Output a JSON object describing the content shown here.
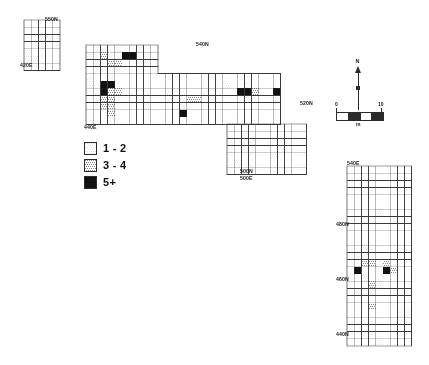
{
  "figure": {
    "type": "archaeological-site-plan",
    "background_color": "#ffffff",
    "line_color": "#3a3a3a"
  },
  "legend": {
    "title": "",
    "items": [
      {
        "label": "1 - 2",
        "fill": "#d9d9d9",
        "pattern": "light-stipple",
        "range_min": 1,
        "range_max": 2
      },
      {
        "label": "3 - 4",
        "fill": "#8a8a8a",
        "pattern": "medium-stipple",
        "range_min": 3,
        "range_max": 4
      },
      {
        "label": "5+",
        "fill": "#111111",
        "pattern": "solid",
        "range_min": 5,
        "range_max": null
      }
    ]
  },
  "north_arrow": {
    "label": "N"
  },
  "scale_bar": {
    "start_label": "0",
    "end_label": "10",
    "unit_label": "m",
    "segments": 4
  },
  "coordinate_labels": [
    {
      "id": "nw-block-top",
      "text": "550N",
      "x": 45,
      "y": 16,
      "align": "left"
    },
    {
      "id": "nw-block-bottom",
      "text": "420E",
      "x": 20,
      "y": 62,
      "align": "left"
    },
    {
      "id": "main-block-top",
      "text": "540N",
      "x": 196,
      "y": 41,
      "align": "left"
    },
    {
      "id": "main-block-left",
      "text": "440E",
      "x": 84,
      "y": 124,
      "align": "left"
    },
    {
      "id": "east-block-right",
      "text": "520N",
      "x": 300,
      "y": 100,
      "align": "left"
    },
    {
      "id": "south-ext-bot-1",
      "text": "500N",
      "x": 240,
      "y": 168,
      "align": "left"
    },
    {
      "id": "south-ext-bot-2",
      "text": "500E",
      "x": 240,
      "y": 175,
      "align": "left"
    },
    {
      "id": "se-block-top",
      "text": "540E",
      "x": 347,
      "y": 160,
      "align": "left"
    },
    {
      "id": "se-block-480",
      "text": "480N",
      "x": 336,
      "y": 221,
      "align": "left"
    },
    {
      "id": "se-block-460",
      "text": "460N",
      "x": 336,
      "y": 276,
      "align": "left"
    },
    {
      "id": "se-block-440",
      "text": "440N",
      "x": 336,
      "y": 331,
      "align": "left"
    }
  ],
  "chart_data": {
    "type": "heatmap",
    "title": "",
    "xlabel": "Easting (m)",
    "ylabel": "Northing (m)",
    "cell_size_m": 1,
    "value_classes": [
      {
        "label": "1 - 2",
        "fill": "#d9d9d9"
      },
      {
        "label": "3 - 4",
        "fill": "#8a8a8a"
      },
      {
        "label": "5+",
        "fill": "#111111"
      }
    ],
    "blocks": [
      {
        "id": "northwest-block",
        "origin_px": [
          24,
          20
        ],
        "cell_px": 7.2,
        "cols": 5,
        "rows": 7,
        "cells": [
          {
            "c": 2,
            "r": 2,
            "v": 1
          },
          {
            "c": 3,
            "r": 2,
            "v": 1
          },
          {
            "c": 0,
            "r": 4,
            "v": 1
          },
          {
            "c": 0,
            "r": 5,
            "v": 1
          },
          {
            "c": 1,
            "r": 5,
            "v": 1
          }
        ]
      },
      {
        "id": "main-block",
        "origin_px": [
          86,
          45
        ],
        "cell_px": 7.2,
        "cols": 27,
        "rows": 11,
        "notch": {
          "cols_from": 10,
          "rows_to": 4,
          "note": "upper-right step: rows 0-3 only span first 10 columns"
        },
        "cells": [
          {
            "c": 1,
            "r": 0,
            "v": 1
          },
          {
            "c": 4,
            "r": 0,
            "v": 1
          },
          {
            "c": 7,
            "r": 0,
            "v": 1
          },
          {
            "c": 0,
            "r": 1,
            "v": 1
          },
          {
            "c": 2,
            "r": 1,
            "v": 2
          },
          {
            "c": 5,
            "r": 1,
            "v": 3
          },
          {
            "c": 6,
            "r": 1,
            "v": 3
          },
          {
            "c": 8,
            "r": 1,
            "v": 1
          },
          {
            "c": 1,
            "r": 2,
            "v": 1
          },
          {
            "c": 3,
            "r": 2,
            "v": 2
          },
          {
            "c": 4,
            "r": 2,
            "v": 2
          },
          {
            "c": 7,
            "r": 2,
            "v": 1
          },
          {
            "c": 8,
            "r": 2,
            "v": 1
          },
          {
            "c": 0,
            "r": 4,
            "v": 1
          },
          {
            "c": 3,
            "r": 4,
            "v": 1
          },
          {
            "c": 0,
            "r": 5,
            "v": 1
          },
          {
            "c": 2,
            "r": 5,
            "v": 3
          },
          {
            "c": 3,
            "r": 5,
            "v": 3
          },
          {
            "c": 2,
            "r": 6,
            "v": 3
          },
          {
            "c": 3,
            "r": 6,
            "v": 2
          },
          {
            "c": 4,
            "r": 6,
            "v": 2
          },
          {
            "c": 2,
            "r": 7,
            "v": 2
          },
          {
            "c": 3,
            "r": 7,
            "v": 2
          },
          {
            "c": 1,
            "r": 8,
            "v": 1
          },
          {
            "c": 2,
            "r": 8,
            "v": 2
          },
          {
            "c": 3,
            "r": 8,
            "v": 2
          },
          {
            "c": 8,
            "r": 8,
            "v": 1
          },
          {
            "c": 13,
            "r": 8,
            "v": 1
          },
          {
            "c": 14,
            "r": 7,
            "v": 2
          },
          {
            "c": 15,
            "r": 7,
            "v": 2
          },
          {
            "c": 13,
            "r": 9,
            "v": 3
          },
          {
            "c": 3,
            "r": 9,
            "v": 2
          },
          {
            "c": 19,
            "r": 5,
            "v": 1
          },
          {
            "c": 22,
            "r": 5,
            "v": 1
          },
          {
            "c": 21,
            "r": 6,
            "v": 3
          },
          {
            "c": 22,
            "r": 6,
            "v": 3
          },
          {
            "c": 23,
            "r": 6,
            "v": 2
          },
          {
            "c": 26,
            "r": 6,
            "v": 3
          },
          {
            "c": 22,
            "r": 7,
            "v": 1
          },
          {
            "c": 26,
            "r": 7,
            "v": 1
          }
        ]
      },
      {
        "id": "south-extension",
        "origin_px": [
          227,
          124
        ],
        "cell_px": 7.2,
        "cols": 11,
        "rows": 7,
        "cells": [
          {
            "c": 2,
            "r": 1,
            "v": 1
          },
          {
            "c": 3,
            "r": 2,
            "v": 1
          },
          {
            "c": 6,
            "r": 4,
            "v": 1
          },
          {
            "c": 1,
            "r": 5,
            "v": 1
          }
        ]
      },
      {
        "id": "southeast-block",
        "origin_px": [
          347,
          166
        ],
        "cell_px": 7.2,
        "cols": 9,
        "rows": 25,
        "cells": [
          {
            "c": 4,
            "r": 6,
            "v": 1
          },
          {
            "c": 2,
            "r": 11,
            "v": 1
          },
          {
            "c": 1,
            "r": 12,
            "v": 1
          },
          {
            "c": 2,
            "r": 12,
            "v": 1
          },
          {
            "c": 2,
            "r": 13,
            "v": 2
          },
          {
            "c": 3,
            "r": 13,
            "v": 2
          },
          {
            "c": 1,
            "r": 14,
            "v": 3
          },
          {
            "c": 5,
            "r": 13,
            "v": 2
          },
          {
            "c": 5,
            "r": 14,
            "v": 3
          },
          {
            "c": 6,
            "r": 14,
            "v": 2
          },
          {
            "c": 2,
            "r": 15,
            "v": 1
          },
          {
            "c": 3,
            "r": 16,
            "v": 2
          },
          {
            "c": 4,
            "r": 16,
            "v": 1
          },
          {
            "c": 1,
            "r": 17,
            "v": 1
          },
          {
            "c": 3,
            "r": 17,
            "v": 1
          },
          {
            "c": 3,
            "r": 19,
            "v": 2
          },
          {
            "c": 7,
            "r": 20,
            "v": 1
          },
          {
            "c": 8,
            "r": 20,
            "v": 1
          },
          {
            "c": 4,
            "r": 24,
            "v": 1
          }
        ]
      }
    ]
  }
}
